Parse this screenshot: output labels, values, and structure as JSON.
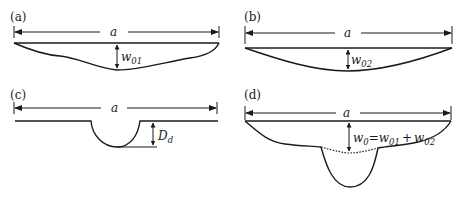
{
  "panels": [
    {
      "id": "a",
      "label": "(a)",
      "span_label": "a",
      "deflection_label": "w",
      "deflection_sub": "01"
    },
    {
      "id": "b",
      "label": "(b)",
      "span_label": "a",
      "deflection_label": "w",
      "deflection_sub": "02"
    },
    {
      "id": "c",
      "label": "(c)",
      "span_label": "a",
      "depth_label": "D",
      "depth_sub": "d"
    },
    {
      "id": "d",
      "label": "(d)",
      "span_label": "a",
      "eq_w": "w",
      "eq_w_sub": "0",
      "eq_sign": "=",
      "eq_t1": "w",
      "eq_t1_sub": "01",
      "eq_plus": "+",
      "eq_t2": "w",
      "eq_t2_sub": "02"
    }
  ]
}
